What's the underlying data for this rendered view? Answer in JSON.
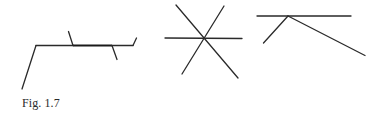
{
  "figure": {
    "caption": "Fig. 1.7",
    "stroke_color": "#2a2a2a",
    "background_color": "#ffffff",
    "panels": [
      {
        "name": "broken-line-with-marked-segment",
        "description": "Polyline rising from lower-left to a horizontal segment, with a bold sub-segment bounded by two transversal ticks, ending in a short upward stroke"
      },
      {
        "name": "three-intersecting-lines",
        "description": "Three lines crossing at a single common point (horizontal and two diagonals)"
      },
      {
        "name": "horizontal-line-with-two-branches",
        "description": "Horizontal line with two segments branching downward from a common point on it"
      }
    ]
  }
}
